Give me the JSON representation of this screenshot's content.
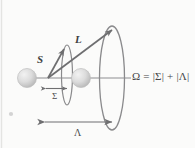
{
  "figure": {
    "kind": "vector-coupling-diagram",
    "background_color": "#fbfbfa",
    "ink_color": "#6e6e70",
    "label_color": "#3f3f41",
    "sphere_color": "#d8d8d8"
  },
  "labels": {
    "spin_vector": "S",
    "orbital_vector": "L",
    "sigma_projection": "Σ",
    "lambda_projection": "Λ",
    "omega_equation": "Ω = |Σ| + |Λ|"
  },
  "elements": {
    "left_sphere": "left-atom-sphere",
    "right_sphere": "right-atom-sphere",
    "internuclear_axis": "internuclear-axis-line",
    "small_cone_ellipse": "sigma-precession-ellipse",
    "large_cone_ellipse": "lambda-precession-ellipse",
    "sigma_measure_arrow": "sigma-measure-arrow",
    "lambda_measure_arrow": "lambda-measure-arrow",
    "stray_dot": "stray-dot-artifact"
  }
}
